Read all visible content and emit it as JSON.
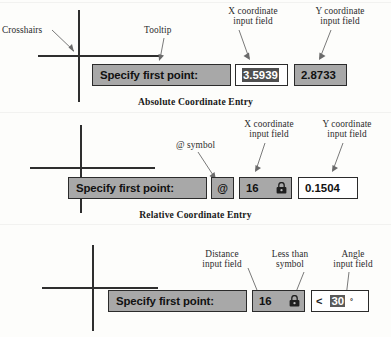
{
  "sections": [
    {
      "id": "absolute",
      "caption": "Absolute Coordinate Entry",
      "prompt": "Specify first point:",
      "labels": {
        "crosshairs": "Crosshairs",
        "tooltip": "Tooltip",
        "x_field_line1": "X coordinate",
        "x_field_line2": "input field",
        "y_field_line1": "Y coordinate",
        "y_field_line2": "input field"
      },
      "fields": {
        "x_value": "3.5939",
        "y_value": "2.8733"
      }
    },
    {
      "id": "relative",
      "caption": "Relative Coordinate Entry",
      "prompt": "Specify first point:",
      "labels": {
        "at_symbol": "@ symbol",
        "x_field_line1": "X coordinate",
        "x_field_line2": "input field",
        "y_field_line1": "Y coordinate",
        "y_field_line2": "input field"
      },
      "fields": {
        "at": "@",
        "x_value": "16",
        "y_value": "0.1504",
        "lock_icon": "lock-icon"
      }
    },
    {
      "id": "polar",
      "caption": "",
      "prompt": "Specify first point:",
      "labels": {
        "distance_line1": "Distance",
        "distance_line2": "input field",
        "lessthan_line1": "Less than",
        "lessthan_line2": "symbol",
        "angle_line1": "Angle",
        "angle_line2": "input field"
      },
      "fields": {
        "distance_value": "16",
        "less_than": "<",
        "angle_value": "30",
        "degree_symbol": "°",
        "lock_icon": "lock-icon"
      }
    }
  ],
  "colors": {
    "tooltip_gray": "#a8a8a8",
    "field_white": "#ffffff",
    "border_dark": "#2b2b2b",
    "selection": "#4f4f4f",
    "page_background": "#fdfdfb",
    "leader_line": "#6a6a6a"
  }
}
